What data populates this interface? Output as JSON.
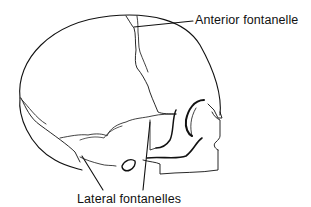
{
  "figure": {
    "labels": {
      "anterior": "Anterior fontanelle",
      "lateral": "Lateral fontanelles"
    },
    "colors": {
      "line": "#111111",
      "background": "#ffffff"
    }
  }
}
